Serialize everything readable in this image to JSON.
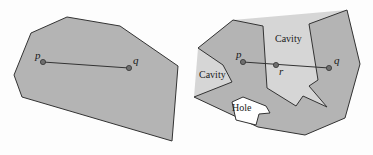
{
  "colors": {
    "background": "#fdfdfd",
    "polygon_fill": "#b4b4b4",
    "cavity_fill": "#d6d6d6",
    "hole_fill": "#ffffff",
    "stroke": "#333333",
    "point_fill": "#6e6e6e"
  },
  "left_figure": {
    "name": "convex-polygon",
    "polygon": [
      [
        67,
        17
      ],
      [
        120,
        26
      ],
      [
        178,
        66
      ],
      [
        172,
        141
      ],
      [
        22,
        97
      ],
      [
        14,
        75
      ],
      [
        31,
        33
      ]
    ],
    "points": [
      {
        "label": "p",
        "x": 43,
        "y": 62,
        "label_x": 35,
        "label_y": 59
      },
      {
        "label": "q",
        "x": 129,
        "y": 68,
        "label_x": 133,
        "label_y": 64
      }
    ],
    "segment": {
      "from": "p",
      "to": "q"
    }
  },
  "right_figure": {
    "name": "non-convex-polygon",
    "hull": [
      [
        198,
        48
      ],
      [
        233,
        20
      ],
      [
        347,
        10
      ],
      [
        360,
        64
      ],
      [
        345,
        118
      ],
      [
        305,
        135
      ],
      [
        258,
        127
      ],
      [
        194,
        97
      ]
    ],
    "polygon": [
      [
        198,
        48
      ],
      [
        233,
        20
      ],
      [
        263,
        26
      ],
      [
        267,
        88
      ],
      [
        296,
        106
      ],
      [
        303,
        96
      ],
      [
        327,
        107
      ],
      [
        309,
        86
      ],
      [
        318,
        80
      ],
      [
        309,
        24
      ],
      [
        347,
        10
      ],
      [
        360,
        64
      ],
      [
        345,
        118
      ],
      [
        305,
        135
      ],
      [
        258,
        127
      ],
      [
        194,
        97
      ],
      [
        232,
        82
      ],
      [
        223,
        65
      ]
    ],
    "hole": [
      [
        232,
        102
      ],
      [
        243,
        97
      ],
      [
        266,
        106
      ],
      [
        270,
        113
      ],
      [
        259,
        114
      ],
      [
        256,
        125
      ],
      [
        236,
        120
      ]
    ],
    "points": [
      {
        "label": "p",
        "x": 243,
        "y": 62,
        "label_x": 236,
        "label_y": 58
      },
      {
        "label": "r",
        "x": 276,
        "y": 65,
        "label_x": 279,
        "label_y": 75
      },
      {
        "label": "q",
        "x": 329,
        "y": 68,
        "label_x": 334,
        "label_y": 64
      }
    ],
    "segment": {
      "from": "p",
      "to": "q"
    },
    "labels": [
      {
        "text": "Cavity",
        "x": 275,
        "y": 42
      },
      {
        "text": "Cavity",
        "x": 199,
        "y": 78
      },
      {
        "text": "Hole",
        "x": 232,
        "y": 111
      }
    ]
  }
}
